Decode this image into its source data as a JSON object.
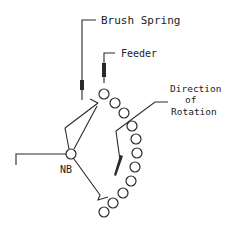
{
  "diagram": {
    "labels": {
      "brush_spring": "Brush Spring",
      "feeder": "Feeder",
      "direction_line1": "Direction",
      "direction_line2": "of",
      "direction_line3": "Rotation",
      "nb": "NB"
    },
    "colors": {
      "line": "#2a2a2a",
      "background": "#ffffff",
      "text": "#222222"
    },
    "circles": [
      {
        "cx": 104,
        "cy": 94
      },
      {
        "cx": 115,
        "cy": 103
      },
      {
        "cx": 124,
        "cy": 113
      },
      {
        "cx": 132,
        "cy": 126
      },
      {
        "cx": 136,
        "cy": 139
      },
      {
        "cx": 137,
        "cy": 153
      },
      {
        "cx": 135,
        "cy": 167
      },
      {
        "cx": 131,
        "cy": 181
      },
      {
        "cx": 123,
        "cy": 193
      },
      {
        "cx": 113,
        "cy": 203
      },
      {
        "cx": 104,
        "cy": 212
      }
    ],
    "nb_node": {
      "cx": 71,
      "cy": 154
    }
  }
}
